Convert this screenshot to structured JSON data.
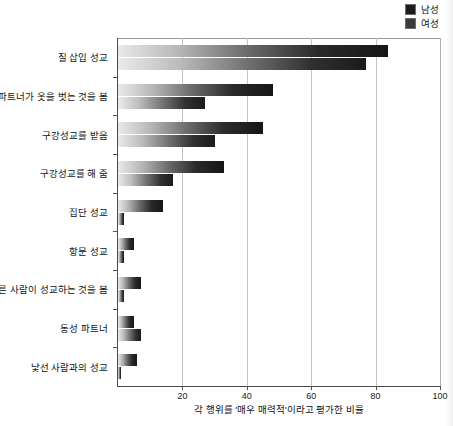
{
  "legend": {
    "position": "top-right",
    "entries": [
      {
        "label": "남성",
        "color": "#1c1c1c",
        "icon": "square-swatch"
      },
      {
        "label": "여성",
        "color": "#3b3b3b",
        "icon": "square-swatch"
      }
    ]
  },
  "axis": {
    "xlabel": "각 행위를 '매우 매력적'이라고 평가한 비율",
    "xticks": [
      "20",
      "40",
      "60",
      "80",
      "100"
    ]
  },
  "chart_data": {
    "type": "bar",
    "orientation": "horizontal",
    "title": "",
    "subtitle": "",
    "xlabel": "각 행위를 '매우 매력적'이라고 평가한 비율",
    "ylabel": "",
    "xlim": [
      0,
      100
    ],
    "ylim": null,
    "grid": "vertical",
    "legend_position": "top-right",
    "categories": [
      "질 삽입 성교",
      "파트너가 옷을 벗는 것을 봄",
      "구강성교를 받음",
      "구강성교를 해 줌",
      "집단 성교",
      "항문 성교",
      "다른 사람이 성교하는 것을 봄",
      "동성 파트너",
      "낯선 사람과의 성교"
    ],
    "series": [
      {
        "name": "남성",
        "color": "#1c1c1c",
        "values": [
          84,
          48,
          45,
          33,
          14,
          5,
          7,
          5,
          6
        ]
      },
      {
        "name": "여성",
        "color": "#3b3b3b",
        "values": [
          77,
          27,
          30,
          17,
          2,
          2,
          2,
          7,
          1
        ]
      }
    ]
  }
}
